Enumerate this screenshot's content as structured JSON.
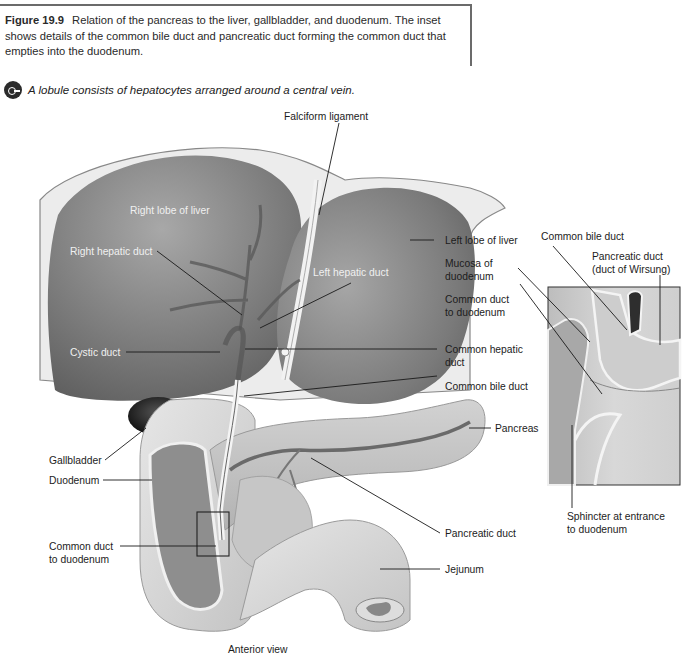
{
  "caption": {
    "figure_number": "Figure 19.9",
    "text": "Relation of the pancreas to the liver, gallbladder, and duodenum. The inset shows details of the common bile duct and pancreatic duct forming the common duct that empties into the duodenum."
  },
  "key_concept": {
    "icon": "key-icon",
    "text": "A lobule consists of hepatocytes arranged around a central vein."
  },
  "figure": {
    "view_label": "Anterior view",
    "labels": {
      "falciform_ligament": "Falciform ligament",
      "right_lobe": "Right lobe of liver",
      "right_hepatic_duct": "Right hepatic duct",
      "left_hepatic_duct": "Left hepatic duct",
      "cystic_duct": "Cystic duct",
      "left_lobe": "Left lobe of liver",
      "common_hepatic_duct_1": "Common hepatic",
      "common_hepatic_duct_2": "duct",
      "common_bile_duct": "Common bile duct",
      "pancreas": "Pancreas",
      "gallbladder": "Gallbladder",
      "duodenum": "Duodenum",
      "common_duct_1": "Common duct",
      "common_duct_2": "to duodenum",
      "pancreatic_duct": "Pancreatic duct",
      "jejunum": "Jejunum"
    },
    "inset_labels": {
      "common_bile_duct": "Common bile duct",
      "pancreatic_duct_1": "Pancreatic duct",
      "pancreatic_duct_2": "(duct of Wirsung)",
      "mucosa_1": "Mucosa of",
      "mucosa_2": "duodenum",
      "common_duct_1": "Common duct",
      "common_duct_2": "to duodenum",
      "sphincter_1": "Sphincter at entrance",
      "sphincter_2": "to duodenum"
    }
  }
}
